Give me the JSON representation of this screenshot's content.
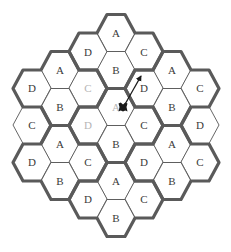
{
  "diagram": {
    "hex_geometry": {
      "half_width": 19,
      "top_half_width": 9,
      "half_height": 18.5
    },
    "colors": {
      "label": "#3a3a3a",
      "label_faded": "#b5b5b5",
      "thin_line": "#555555",
      "thick_line": "#5a5a5a",
      "agent": "#1a1a1a"
    },
    "hexes": [
      {
        "label": "A",
        "x": 116,
        "y": 33,
        "faded": false
      },
      {
        "label": "D",
        "x": 88,
        "y": 52,
        "faded": false
      },
      {
        "label": "C",
        "x": 144,
        "y": 52,
        "faded": false
      },
      {
        "label": "B",
        "x": 116,
        "y": 70,
        "faded": false
      },
      {
        "label": "A",
        "x": 60,
        "y": 70,
        "faded": false
      },
      {
        "label": "D",
        "x": 32,
        "y": 88,
        "faded": false
      },
      {
        "label": "C",
        "x": 88,
        "y": 88,
        "faded": true
      },
      {
        "label": "B",
        "x": 60,
        "y": 107,
        "faded": false
      },
      {
        "label": "A",
        "x": 172,
        "y": 70,
        "faded": false
      },
      {
        "label": "D",
        "x": 144,
        "y": 88,
        "faded": false
      },
      {
        "label": "C",
        "x": 200,
        "y": 88,
        "faded": false
      },
      {
        "label": "B",
        "x": 172,
        "y": 107,
        "faded": false
      },
      {
        "label": "A",
        "x": 116,
        "y": 107,
        "faded": true
      },
      {
        "label": "D",
        "x": 88,
        "y": 125,
        "faded": true
      },
      {
        "label": "C",
        "x": 144,
        "y": 125,
        "faded": false
      },
      {
        "label": "B",
        "x": 116,
        "y": 144,
        "faded": false
      },
      {
        "label": "C",
        "x": 32,
        "y": 125,
        "faded": false
      },
      {
        "label": "D",
        "x": 200,
        "y": 125,
        "faded": false
      },
      {
        "label": "A",
        "x": 60,
        "y": 144,
        "faded": false
      },
      {
        "label": "D",
        "x": 32,
        "y": 162,
        "faded": false
      },
      {
        "label": "C",
        "x": 88,
        "y": 162,
        "faded": false
      },
      {
        "label": "B",
        "x": 60,
        "y": 181,
        "faded": false
      },
      {
        "label": "A",
        "x": 172,
        "y": 144,
        "faded": false
      },
      {
        "label": "D",
        "x": 144,
        "y": 162,
        "faded": false
      },
      {
        "label": "C",
        "x": 200,
        "y": 162,
        "faded": false
      },
      {
        "label": "B",
        "x": 172,
        "y": 181,
        "faded": false
      },
      {
        "label": "A",
        "x": 116,
        "y": 181,
        "faded": false
      },
      {
        "label": "D",
        "x": 88,
        "y": 199,
        "faded": false
      },
      {
        "label": "C",
        "x": 144,
        "y": 199,
        "faded": false
      },
      {
        "label": "B",
        "x": 116,
        "y": 218,
        "faded": false
      }
    ],
    "clusters": [
      {
        "top": [
          116,
          33
        ]
      },
      {
        "top": [
          60,
          70
        ]
      },
      {
        "top": [
          172,
          70
        ]
      },
      {
        "top": [
          116,
          107
        ]
      },
      {
        "top": [
          60,
          144
        ]
      },
      {
        "top": [
          172,
          144
        ]
      },
      {
        "top": [
          116,
          181
        ]
      }
    ],
    "edge_partial_clusters": [
      {
        "hex": [
          32,
          125
        ],
        "side": "left"
      },
      {
        "hex": [
          200,
          125
        ],
        "side": "right"
      }
    ],
    "agent": {
      "icon": "agent-robot-icon",
      "x": 123,
      "y": 107,
      "size": 9
    },
    "arrow": {
      "from": [
        124,
        106
      ],
      "to": [
        141,
        76
      ]
    }
  }
}
